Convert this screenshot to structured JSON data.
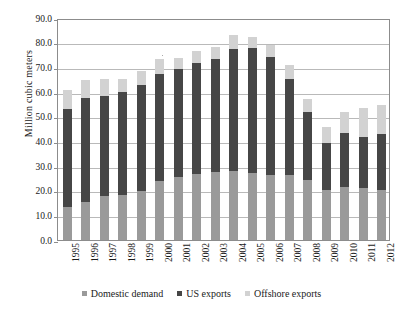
{
  "chart_data": {
    "type": "bar",
    "subtype": "stacked-vertical",
    "title": "",
    "xlabel": "",
    "ylabel": "Million cubic meters",
    "ylim": [
      0.0,
      90.0
    ],
    "ytick_step": 10.0,
    "ytick_labels": [
      "90.0",
      "80.0",
      "70.0",
      "60.0",
      "50.0",
      "40.0",
      "30.0",
      "20.0",
      "10.0",
      "0.0"
    ],
    "ytick_values": [
      90.0,
      80.0,
      70.0,
      60.0,
      50.0,
      40.0,
      30.0,
      20.0,
      10.0,
      0.0
    ],
    "grid": true,
    "grid_axis": "y",
    "legend_position": "bottom",
    "categories": [
      "1995",
      "1996",
      "1997",
      "1998",
      "1999",
      "2000",
      "2001",
      "2002",
      "2003",
      "2004",
      "2005",
      "2006",
      "2007",
      "2008",
      "2009",
      "2010",
      "2011",
      "2012"
    ],
    "series": [
      {
        "name": "Domestic demand",
        "color": "#9a9a9a",
        "values": [
          13.2,
          15.4,
          17.5,
          17.9,
          19.8,
          23.9,
          25.2,
          26.5,
          27.3,
          27.9,
          27.1,
          26.3,
          26.0,
          24.2,
          20.0,
          21.4,
          20.7,
          20.2
        ]
      },
      {
        "name": "US exports",
        "color": "#464646",
        "values": [
          39.9,
          41.8,
          40.8,
          42.1,
          42.9,
          43.4,
          43.9,
          44.9,
          45.7,
          49.5,
          50.7,
          47.5,
          39.1,
          27.3,
          19.0,
          21.6,
          20.8,
          22.4
        ]
      },
      {
        "name": "Offshore exports",
        "color": "#d2d2d2",
        "values": [
          7.4,
          7.6,
          6.9,
          4.9,
          5.8,
          5.8,
          4.4,
          5.1,
          5.1,
          5.6,
          4.3,
          5.2,
          5.5,
          5.5,
          6.5,
          8.6,
          12.0,
          11.9
        ]
      }
    ],
    "totals": [
      60.5,
      64.8,
      65.2,
      64.9,
      68.5,
      73.1,
      73.5,
      76.5,
      78.1,
      83.0,
      82.1,
      79.0,
      70.6,
      57.0,
      45.5,
      51.6,
      53.5,
      54.5
    ],
    "axis_color": "#8c8c8c",
    "gridline_color": "#b9b9b9",
    "background": "#ffffff"
  },
  "legend": {
    "items": [
      {
        "label": "Domestic demand"
      },
      {
        "label": "US exports"
      },
      {
        "label": "Offshore exports"
      }
    ]
  }
}
